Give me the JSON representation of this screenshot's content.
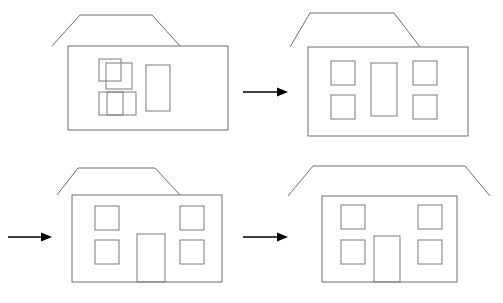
{
  "page": {
    "width": 503,
    "height": 303,
    "background_color": "#ffffff"
  },
  "colors": {
    "background": "#ffffff",
    "house_stroke": "#6e6e6e",
    "window_stroke": "#7a7a7a",
    "arrow": "#000000"
  },
  "panels": [
    {
      "id": "panel-1",
      "position": "top-left",
      "step_label": "1",
      "caption": "",
      "house": {
        "wall": {
          "x": 68,
          "y": 46,
          "width": 160,
          "height": 84
        },
        "roof": {
          "type": "trapezoid",
          "points": "52,46 80,15 152,15 180,46",
          "eave_left_x": 52,
          "eave_right_x": 180,
          "ridge_left_x": 80,
          "ridge_right_x": 152,
          "eave_y": 46,
          "ridge_y": 15,
          "overhang_style": "left-shifted, does not span full wall"
        },
        "windows": [
          {
            "name": "window-upper-left-back",
            "x": 99,
            "y": 59,
            "width": 22,
            "height": 22
          },
          {
            "name": "window-upper-left-front",
            "x": 106,
            "y": 63,
            "width": 26,
            "height": 26
          },
          {
            "name": "window-lower-left-back",
            "x": 99,
            "y": 92,
            "width": 24,
            "height": 23
          },
          {
            "name": "window-lower-left-front",
            "x": 107,
            "y": 92,
            "width": 29,
            "height": 23
          }
        ],
        "door": {
          "name": "door-tall-rectangle",
          "x": 146,
          "y": 65,
          "width": 24,
          "height": 46
        }
      },
      "notes": "Rough sketch: roof offset to the left, windows overlap each other and are misaligned, door floats above the ground line."
    },
    {
      "id": "panel-2",
      "position": "top-right",
      "step_label": "2",
      "caption": "",
      "house": {
        "wall": {
          "x": 308,
          "y": 47,
          "width": 160,
          "height": 89
        },
        "roof": {
          "type": "trapezoid",
          "points": "290,47 310,13 394,13 420,47",
          "eave_left_x": 290,
          "eave_right_x": 420,
          "ridge_left_x": 310,
          "ridge_right_x": 394,
          "eave_y": 47,
          "ridge_y": 13,
          "overhang_style": "left-shifted, does not span full wall"
        },
        "windows": [
          {
            "name": "window-top-left",
            "x": 331,
            "y": 61,
            "width": 24,
            "height": 24
          },
          {
            "name": "window-bottom-left",
            "x": 331,
            "y": 95,
            "width": 24,
            "height": 24
          },
          {
            "name": "window-top-right",
            "x": 413,
            "y": 61,
            "width": 24,
            "height": 24
          },
          {
            "name": "window-bottom-right",
            "x": 413,
            "y": 95,
            "width": 24,
            "height": 24
          }
        ],
        "door": {
          "name": "door-center-rectangle",
          "x": 371,
          "y": 63,
          "width": 26,
          "height": 53
        }
      },
      "notes": "Windows now aligned into a symmetric 2x2 arrangement with a centered door, but the door still floats above the ground line."
    },
    {
      "id": "panel-3",
      "position": "bottom-left",
      "step_label": "3",
      "caption": "",
      "house": {
        "wall": {
          "x": 72,
          "y": 195,
          "width": 150,
          "height": 87
        },
        "roof": {
          "type": "trapezoid",
          "points": "57,195 78,168 155,168 180,195",
          "eave_left_x": 57,
          "eave_right_x": 180,
          "ridge_left_x": 78,
          "ridge_right_x": 155,
          "eave_y": 195,
          "ridge_y": 168,
          "overhang_style": "left-shifted, does not span full wall"
        },
        "windows": [
          {
            "name": "window-top-left",
            "x": 95,
            "y": 206,
            "width": 24,
            "height": 24
          },
          {
            "name": "window-bottom-left",
            "x": 95,
            "y": 240,
            "width": 24,
            "height": 24
          },
          {
            "name": "window-top-right",
            "x": 180,
            "y": 206,
            "width": 24,
            "height": 24
          },
          {
            "name": "window-bottom-right",
            "x": 180,
            "y": 240,
            "width": 24,
            "height": 24
          }
        ],
        "door": {
          "name": "door-ground-level",
          "x": 137,
          "y": 234,
          "width": 28,
          "height": 48,
          "reaches_ground": true
        }
      },
      "notes": "Door now extends down to the ground line of the wall."
    },
    {
      "id": "panel-4",
      "position": "bottom-right",
      "step_label": "4",
      "caption": "",
      "house": {
        "wall": {
          "x": 322,
          "y": 196,
          "width": 135,
          "height": 86
        },
        "roof": {
          "type": "trapezoid",
          "points": "288,196 313,166 465,166 490,196",
          "eave_left_x": 288,
          "eave_right_x": 490,
          "ridge_left_x": 313,
          "ridge_right_x": 465,
          "eave_y": 196,
          "ridge_y": 166,
          "overhang_style": "wide symmetric eaves spanning beyond both wall edges"
        },
        "windows": [
          {
            "name": "window-top-left",
            "x": 341,
            "y": 205,
            "width": 24,
            "height": 24
          },
          {
            "name": "window-bottom-left",
            "x": 341,
            "y": 240,
            "width": 24,
            "height": 24
          },
          {
            "name": "window-top-right",
            "x": 418,
            "y": 205,
            "width": 24,
            "height": 24
          },
          {
            "name": "window-bottom-right",
            "x": 418,
            "y": 240,
            "width": 24,
            "height": 24
          }
        ],
        "door": {
          "name": "door-ground-level",
          "x": 374,
          "y": 236,
          "width": 26,
          "height": 46,
          "reaches_ground": true
        }
      },
      "notes": "Final form: roof widened and flattened into symmetric eaves centered over the wall."
    }
  ],
  "arrows": [
    {
      "id": "arrow-1",
      "name": "arrow-panel1-to-panel2",
      "direction": "right",
      "from_panel": "panel-1",
      "to_panel": "panel-2",
      "x1": 243,
      "y1": 92,
      "x2": 288,
      "y2": 92
    },
    {
      "id": "arrow-2",
      "name": "arrow-panel2-to-panel3",
      "direction": "right",
      "from_panel": "panel-2",
      "to_panel": "panel-3",
      "x1": 8,
      "y1": 237,
      "x2": 52,
      "y2": 237
    },
    {
      "id": "arrow-3",
      "name": "arrow-panel3-to-panel4",
      "direction": "right",
      "from_panel": "panel-3",
      "to_panel": "panel-4",
      "x1": 243,
      "y1": 237,
      "x2": 288,
      "y2": 237
    }
  ]
}
